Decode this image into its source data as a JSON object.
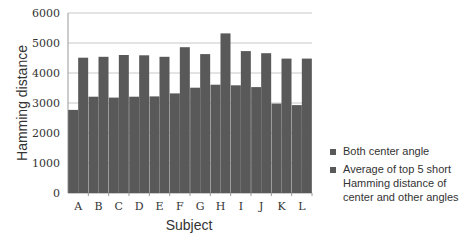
{
  "chart_data": {
    "type": "bar",
    "title": "",
    "xlabel": "Subject",
    "ylabel": "Hamming distance",
    "ylim": [
      0,
      6000
    ],
    "yticks": [
      0,
      1000,
      2000,
      3000,
      4000,
      5000,
      6000
    ],
    "grid": true,
    "legend_position": "right",
    "categories": [
      "A",
      "B",
      "C",
      "D",
      "E",
      "F",
      "G",
      "H",
      "I",
      "J",
      "K",
      "L"
    ],
    "series": [
      {
        "name": "Both center angle",
        "color": "#595959",
        "values": [
          2770,
          3210,
          3180,
          3210,
          3220,
          3320,
          3510,
          3610,
          3590,
          3530,
          2980,
          2930
        ]
      },
      {
        "name": "Average of top 5 short Hamming distance of center and other angles",
        "color": "#595959",
        "values": [
          4510,
          4540,
          4600,
          4590,
          4540,
          4860,
          4630,
          5320,
          4730,
          4660,
          4480,
          4480
        ]
      }
    ],
    "legend_lines": [
      [
        "Both center angle"
      ],
      [
        "Average of top 5 short",
        "Hamming distance of",
        "center and other angles"
      ]
    ]
  }
}
